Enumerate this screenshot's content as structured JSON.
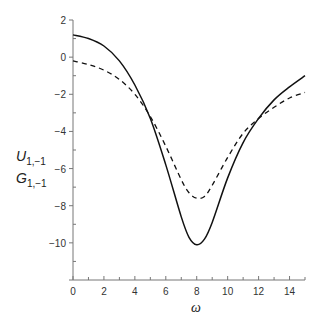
{
  "chart_data": {
    "type": "line",
    "title": "",
    "xlabel": "ω",
    "ylabel_lines": [
      {
        "main": "U",
        "sub": "1,−1"
      },
      {
        "main": "G",
        "sub": "1,−1"
      }
    ],
    "xlim": [
      0,
      15
    ],
    "ylim": [
      -12,
      2
    ],
    "x_ticks": [
      0,
      2,
      4,
      6,
      8,
      10,
      12,
      14
    ],
    "x_tick_labels": [
      "0",
      "2",
      "4",
      "6",
      "8",
      "10",
      "12",
      "14"
    ],
    "y_ticks": [
      2,
      0,
      -2,
      -4,
      -6,
      -8,
      -10
    ],
    "y_tick_labels": [
      "2",
      "0",
      "−2",
      "−4",
      "−6",
      "−8",
      "−10"
    ],
    "grid": false,
    "legend": null,
    "series": [
      {
        "name": "U_{1,-1}",
        "style": "solid",
        "color": "#111111",
        "x": [
          0,
          1,
          2,
          3,
          4,
          5,
          6,
          7,
          7.5,
          8,
          8.5,
          9,
          10,
          11,
          12,
          13,
          14,
          15
        ],
        "values": [
          1.2,
          1.0,
          0.6,
          -0.2,
          -1.5,
          -3.3,
          -5.8,
          -8.6,
          -9.7,
          -10.1,
          -9.8,
          -8.9,
          -6.5,
          -4.6,
          -3.3,
          -2.3,
          -1.6,
          -1.0
        ]
      },
      {
        "name": "G_{1,-1}",
        "style": "dashed",
        "color": "#111111",
        "x": [
          0,
          1,
          2,
          3,
          4,
          5,
          6,
          7,
          7.5,
          8,
          8.5,
          9,
          10,
          11,
          12,
          13,
          14,
          15
        ],
        "values": [
          -0.2,
          -0.4,
          -0.7,
          -1.2,
          -2.0,
          -3.2,
          -4.8,
          -6.6,
          -7.3,
          -7.6,
          -7.5,
          -6.9,
          -5.4,
          -4.1,
          -3.3,
          -2.7,
          -2.2,
          -1.9
        ]
      }
    ]
  }
}
